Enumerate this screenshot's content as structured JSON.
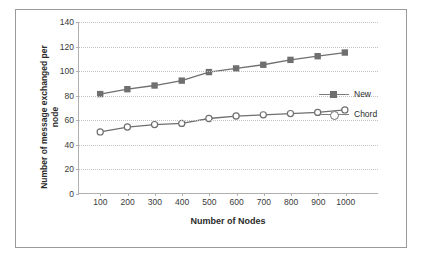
{
  "chart_data": {
    "type": "line",
    "title": "",
    "xlabel": "Number of Nodes",
    "ylabel": "Number of message exchanged per node",
    "categories": [
      100,
      200,
      300,
      400,
      500,
      600,
      700,
      800,
      900,
      1000
    ],
    "xtick_labels": [
      "100",
      "200",
      "300",
      "400",
      "500",
      "600",
      "700",
      "800",
      "900",
      "1000"
    ],
    "ytick_labels": [
      "0",
      "20",
      "40",
      "60",
      "80",
      "100",
      "120",
      "140"
    ],
    "ylim": [
      0,
      140
    ],
    "ytick_step": 20,
    "grid": "horizontal-dotted",
    "legend_position": "right-inside",
    "series": [
      {
        "name": "New",
        "marker": "square",
        "color": "#6f6f6f",
        "values": [
          81,
          85,
          88,
          92,
          99,
          102,
          105,
          109,
          112,
          115
        ]
      },
      {
        "name": "Chord",
        "marker": "circle",
        "color": "#6f6f6f",
        "values": [
          50,
          54,
          56,
          57,
          61,
          63,
          64,
          65,
          66,
          68
        ]
      }
    ]
  },
  "legend": {
    "items": [
      {
        "label": "New",
        "marker": "square-marker"
      },
      {
        "label": "Chord",
        "marker": "circle-marker"
      }
    ]
  }
}
